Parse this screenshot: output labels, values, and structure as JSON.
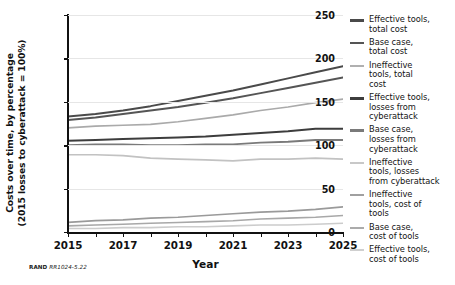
{
  "chart_data": {
    "type": "line",
    "title": "",
    "xlabel": "Year",
    "ylabel_line1": "Costs over time, by percentage",
    "ylabel_line2": "(2015 losses to cyberattack = 100%)",
    "x": [
      2015,
      2016,
      2017,
      2018,
      2019,
      2020,
      2021,
      2022,
      2023,
      2024,
      2025
    ],
    "xlim": [
      2015,
      2025
    ],
    "ylim": [
      0,
      250
    ],
    "xticks": [
      2015,
      2016,
      2017,
      2018,
      2019,
      2020,
      2021,
      2022,
      2023,
      2024,
      2025
    ],
    "xticklabels": [
      "2015",
      "",
      "2017",
      "",
      "2019",
      "",
      "2021",
      "",
      "2023",
      "",
      "2025"
    ],
    "yticks": [
      0,
      50,
      100,
      150,
      200,
      250
    ],
    "yticklabels": [
      "0",
      "50",
      "100",
      "150",
      "200",
      "250"
    ],
    "grid": true,
    "legend_position": "right",
    "series": [
      {
        "name": "Effective tools, total cost",
        "color": "#4a4a4a",
        "width": 2.0,
        "values": [
          133,
          136,
          140,
          145,
          151,
          157,
          163,
          170,
          177,
          184,
          191
        ]
      },
      {
        "name": "Base case, total cost",
        "color": "#555555",
        "width": 2.0,
        "values": [
          129,
          132,
          136,
          140,
          144,
          149,
          154,
          160,
          166,
          172,
          178
        ]
      },
      {
        "name": "Ineffective tools, total cost",
        "color": "#aaaaaa",
        "width": 1.7,
        "values": [
          120,
          122,
          123,
          124,
          127,
          131,
          135,
          140,
          144,
          149,
          153
        ]
      },
      {
        "name": "Effective tools, losses from cyberattack",
        "color": "#3d3d3d",
        "width": 2.0,
        "values": [
          105,
          106,
          107,
          108,
          109,
          110,
          112,
          114,
          116,
          119,
          119
        ]
      },
      {
        "name": "Base case, losses from cyberattack",
        "color": "#7a7a7a",
        "width": 1.8,
        "values": [
          100,
          101,
          101,
          100,
          100,
          101,
          101,
          103,
          104,
          106,
          106
        ]
      },
      {
        "name": "Ineffective tools, losses from cyberattack",
        "color": "#c2c2c2",
        "width": 1.7,
        "values": [
          89,
          89,
          88,
          85,
          84,
          83,
          82,
          84,
          84,
          85,
          84
        ]
      },
      {
        "name": "Ineffective tools, cost of tools",
        "color": "#9a9a9a",
        "width": 1.7,
        "values": [
          11,
          13,
          14,
          16,
          17,
          19,
          21,
          23,
          24,
          26,
          29
        ]
      },
      {
        "name": "Base case, cost of tools",
        "color": "#a8a8a8",
        "width": 1.6,
        "values": [
          7,
          8,
          9,
          10,
          11,
          12,
          13,
          15,
          16,
          17,
          19
        ]
      },
      {
        "name": "Effective tools, cost of tools",
        "color": "#cccccc",
        "width": 1.6,
        "values": [
          4,
          4,
          5,
          5,
          6,
          6,
          7,
          8,
          8,
          9,
          10
        ]
      }
    ]
  },
  "legend": {
    "items": [
      {
        "label_lines": [
          "Effective tools,",
          "total cost"
        ],
        "color": "#4a4a4a",
        "width": 2.6
      },
      {
        "label_lines": [
          "Base case,",
          "total cost"
        ],
        "color": "#555555",
        "width": 2.6
      },
      {
        "label_lines": [
          "Ineffective",
          "tools, total",
          "cost"
        ],
        "color": "#b0b0b0",
        "width": 2.0
      },
      {
        "label_lines": [
          "Effective tools,",
          "losses from",
          "cyberattack"
        ],
        "color": "#3d3d3d",
        "width": 2.8
      },
      {
        "label_lines": [
          "Base case,",
          "losses from",
          "cyberattack"
        ],
        "color": "#7a7a7a",
        "width": 2.4
      },
      {
        "label_lines": [
          "Ineffective",
          "tools, losses",
          "from cyberattack"
        ],
        "color": "#c8c8c8",
        "width": 2.0
      },
      {
        "label_lines": [
          "Ineffective",
          "tools, cost of",
          "tools"
        ],
        "color": "#a0a0a0",
        "width": 2.2
      },
      {
        "label_lines": [
          "Base case,",
          "cost of tools"
        ],
        "color": "#ababab",
        "width": 2.2
      },
      {
        "label_lines": [
          "Effective tools,",
          "cost of tools"
        ],
        "color": "#cfcfcf",
        "width": 2.0
      }
    ]
  },
  "footnote": {
    "prefix": "RAND",
    "id": "RR1024-5.22"
  }
}
